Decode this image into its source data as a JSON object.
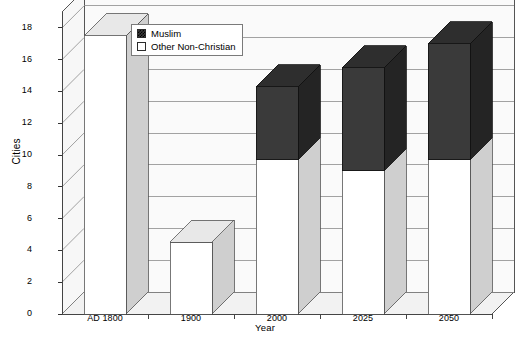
{
  "chart_data": {
    "type": "bar",
    "subtype": "stacked-column-3d",
    "title": "",
    "xlabel": "Year",
    "ylabel": "Cities",
    "categories": [
      "AD 1800",
      "1900",
      "2000",
      "2025",
      "2050"
    ],
    "series": [
      {
        "name": "Other Non-Christian",
        "color": "#ffffff",
        "values": [
          17.5,
          4.5,
          9.7,
          9.0,
          9.7
        ]
      },
      {
        "name": "Muslim",
        "color": "#3a3a3a",
        "values": [
          0,
          0,
          4.6,
          6.5,
          7.3
        ]
      }
    ],
    "totals": [
      17.5,
      4.5,
      14.3,
      15.5,
      17.0
    ],
    "ylim": [
      0,
      19
    ],
    "yticks": [
      0,
      2,
      4,
      6,
      8,
      10,
      12,
      14,
      16,
      18
    ],
    "ytick_labels": [
      "0",
      "2",
      "4",
      "6",
      "8",
      "10",
      "12",
      "14",
      "16",
      "18"
    ],
    "grid": true,
    "legend_position": "top-left-inside",
    "legend_entries": [
      "Muslim",
      "Other Non-Christian"
    ]
  },
  "axes": {
    "y_title": "Cities",
    "x_title": "Year"
  },
  "legend": {
    "muslim_label": "Muslim",
    "other_label": "Other Non-Christian"
  },
  "colors": {
    "muslim_front": "#3a3a3a",
    "muslim_top": "#2e2e2e",
    "muslim_side": "#242424",
    "other_front": "#ffffff",
    "other_top": "#e8e8e8",
    "other_side": "#cfcfcf",
    "grid": "#8c8c8c",
    "floor": "#f2f2f2",
    "wall": "#fafafa",
    "axis": "#555555"
  }
}
